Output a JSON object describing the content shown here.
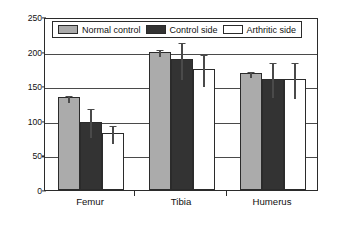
{
  "chart_data": {
    "type": "bar",
    "title": "",
    "subtitle": "",
    "xlabel": "",
    "ylabel": "Ultimate bending strength (MPa)",
    "ylim": [
      0,
      250
    ],
    "ytick_labels": [
      "0",
      "50",
      "100",
      "150",
      "200",
      "250"
    ],
    "ytick_values": [
      0,
      50,
      100,
      150,
      200,
      250
    ],
    "grid": true,
    "grid_axis": "y",
    "legend_position": "top-inside",
    "categories": [
      "Femur",
      "Tibia",
      "Humerus"
    ],
    "series": [
      {
        "name": "Normal control",
        "color": "#ababab",
        "values": [
          134,
          200,
          169
        ],
        "errors": [
          5,
          5,
          5
        ]
      },
      {
        "name": "Control side",
        "color": "#333333",
        "values": [
          99,
          189,
          161
        ],
        "errors": [
          21,
          27,
          25
        ]
      },
      {
        "name": "Arthritic side",
        "color": "#ffffff",
        "values": [
          82,
          175,
          160
        ],
        "errors": [
          13,
          23,
          26
        ]
      }
    ]
  },
  "axes": {
    "y_title": "Ultimate bending strength (MPa)",
    "y_labels": [
      "250",
      "200",
      "150",
      "100",
      "50",
      "0"
    ],
    "x_labels": [
      "Femur",
      "Tibia",
      "Humerus"
    ]
  },
  "legend": {
    "items": [
      {
        "label": "Normal control",
        "swatch": "normal"
      },
      {
        "label": "Control side",
        "swatch": "control"
      },
      {
        "label": "Arthritic side",
        "swatch": "arthritic"
      }
    ]
  }
}
